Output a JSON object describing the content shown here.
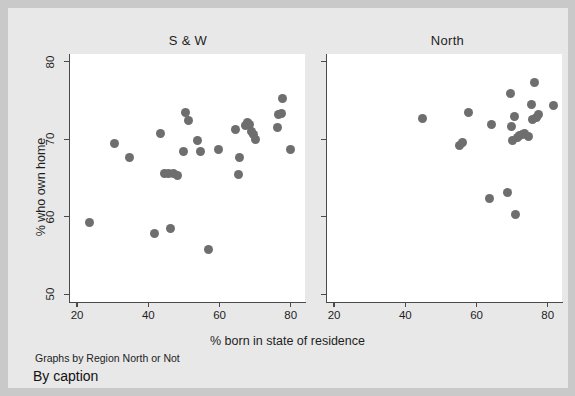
{
  "figure": {
    "background_color": "#e8e8e8",
    "plot_background_color": "#ffffff",
    "marker_color": "#6e6e6e",
    "axis_color": "#4a4a4a",
    "note": "Graphs by Region North or Not",
    "caption": "By caption"
  },
  "chart_data": {
    "type": "scatter",
    "title": "",
    "xlabel": "% born in state of residence",
    "ylabel": "% who own home",
    "xlim": [
      18,
      84
    ],
    "ylim": [
      49,
      81
    ],
    "xticks": [
      20,
      40,
      60,
      80
    ],
    "yticks": [
      50,
      60,
      70,
      80
    ],
    "grid": false,
    "legend": "none",
    "panel_layout": "1x2 by group",
    "panels": [
      {
        "label": "S & W",
        "series": [
          {
            "name": "S & W",
            "points": [
              [
                23.6,
                59.3
              ],
              [
                30.6,
                69.5
              ],
              [
                34.7,
                67.6
              ],
              [
                41.8,
                57.9
              ],
              [
                43.3,
                70.8
              ],
              [
                44.6,
                65.6
              ],
              [
                45.6,
                65.6
              ],
              [
                46.2,
                58.5
              ],
              [
                47.1,
                65.6
              ],
              [
                48.2,
                65.3
              ],
              [
                49.8,
                68.4
              ],
              [
                50.3,
                73.5
              ],
              [
                51.3,
                72.4
              ],
              [
                53.8,
                69.9
              ],
              [
                54.6,
                68.4
              ],
              [
                56.8,
                55.8
              ],
              [
                59.7,
                68.7
              ],
              [
                64.6,
                71.3
              ],
              [
                65.2,
                65.4
              ],
              [
                65.6,
                67.7
              ],
              [
                67.2,
                71.8
              ],
              [
                67.9,
                72.2
              ],
              [
                68.3,
                71.9
              ],
              [
                69.0,
                71.0
              ],
              [
                69.6,
                70.6
              ],
              [
                70.2,
                70.0
              ],
              [
                76.3,
                71.5
              ],
              [
                76.6,
                73.2
              ],
              [
                77.4,
                73.3
              ],
              [
                77.8,
                75.2
              ],
              [
                79.8,
                68.7
              ]
            ]
          }
        ]
      },
      {
        "label": "North",
        "series": [
          {
            "name": "North",
            "points": [
              [
                44.8,
                72.7
              ],
              [
                55.2,
                69.2
              ],
              [
                56.1,
                69.6
              ],
              [
                57.6,
                73.5
              ],
              [
                63.6,
                62.4
              ],
              [
                64.2,
                71.9
              ],
              [
                68.8,
                63.1
              ],
              [
                69.4,
                75.9
              ],
              [
                69.8,
                71.7
              ],
              [
                70.2,
                69.9
              ],
              [
                70.6,
                72.9
              ],
              [
                71.0,
                60.3
              ],
              [
                71.4,
                70.2
              ],
              [
                72.1,
                70.5
              ],
              [
                72.8,
                70.6
              ],
              [
                73.6,
                70.8
              ],
              [
                74.5,
                70.4
              ],
              [
                75.3,
                74.5
              ],
              [
                75.8,
                72.5
              ],
              [
                76.2,
                77.3
              ],
              [
                76.8,
                72.8
              ],
              [
                77.3,
                73.2
              ],
              [
                81.6,
                74.4
              ]
            ]
          }
        ]
      }
    ]
  }
}
